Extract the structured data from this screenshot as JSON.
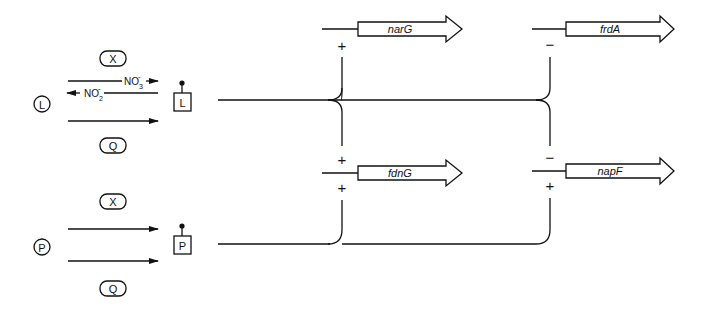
{
  "diagram": {
    "type": "regulatory-network",
    "sensors": [
      {
        "id": "L",
        "label": "L",
        "signals": {
          "x_label": "X",
          "q_label": "Q",
          "no3": "NO",
          "no3_sub": "3",
          "no3_sup": "-",
          "no2": "NO",
          "no2_sub": "2",
          "no2_sup": "-"
        },
        "regulator_label": "L"
      },
      {
        "id": "P",
        "label": "P",
        "signals": {
          "x_label": "X",
          "q_label": "Q"
        },
        "regulator_label": "P"
      }
    ],
    "genes": [
      {
        "name": "narG",
        "upper_sign": "",
        "lower_sign": "+",
        "regulated_by_L": "+",
        "regulated_by_P": ""
      },
      {
        "name": "frdA",
        "regulated_by_L": "−"
      },
      {
        "name": "fdnG",
        "regulated_by_L": "+",
        "regulated_by_P": "+"
      },
      {
        "name": "napF",
        "regulated_by_L": "−",
        "regulated_by_P": "+"
      }
    ],
    "signs": {
      "narG_L": "+",
      "fdnG_L": "+",
      "fdnG_P": "+",
      "frdA_L": "−",
      "napF_L": "−",
      "napF_P": "+"
    }
  }
}
